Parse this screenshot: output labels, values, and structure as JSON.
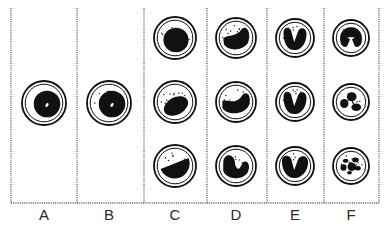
{
  "diagram": {
    "colors": {
      "ink": "#111111",
      "divider": "#555555",
      "background": "#ffffff"
    },
    "columns": [
      {
        "label": "A",
        "x": 44,
        "cells": [
          {
            "y": 103,
            "r": 22,
            "nucleus": "round-nucleolus",
            "granules": false
          }
        ]
      },
      {
        "label": "B",
        "x": 109,
        "cells": [
          {
            "y": 103,
            "r": 22,
            "nucleus": "round-nucleolus",
            "granules": true
          }
        ]
      },
      {
        "label": "C",
        "x": 175,
        "cells": [
          {
            "y": 38,
            "r": 21,
            "nucleus": "round",
            "granules": true
          },
          {
            "y": 102,
            "r": 21,
            "nucleus": "oval-tilted",
            "granules": true
          },
          {
            "y": 166,
            "r": 21,
            "nucleus": "half-moon",
            "granules": true
          }
        ]
      },
      {
        "label": "D",
        "x": 236,
        "cells": [
          {
            "y": 38,
            "r": 20,
            "nucleus": "kidney",
            "granules": true
          },
          {
            "y": 102,
            "r": 20,
            "nucleus": "kidney-indented",
            "granules": true
          },
          {
            "y": 166,
            "r": 20,
            "nucleus": "kidney-deep",
            "granules": true
          }
        ]
      },
      {
        "label": "E",
        "x": 295,
        "cells": [
          {
            "y": 38,
            "r": 19,
            "nucleus": "band-u",
            "granules": true
          },
          {
            "y": 102,
            "r": 19,
            "nucleus": "band-u",
            "granules": true
          },
          {
            "y": 166,
            "r": 19,
            "nucleus": "band-u-wide",
            "granules": true
          }
        ]
      },
      {
        "label": "F",
        "x": 351,
        "cells": [
          {
            "y": 38,
            "r": 18,
            "nucleus": "segmented-2",
            "granules": true
          },
          {
            "y": 102,
            "r": 18,
            "nucleus": "segmented-3",
            "granules": true
          },
          {
            "y": 166,
            "r": 18,
            "nucleus": "segmented-5",
            "granules": true
          }
        ]
      }
    ],
    "dividers_x": [
      11,
      77,
      144,
      207,
      267,
      324,
      379
    ],
    "top_y": 8,
    "baseline_y": 203
  }
}
